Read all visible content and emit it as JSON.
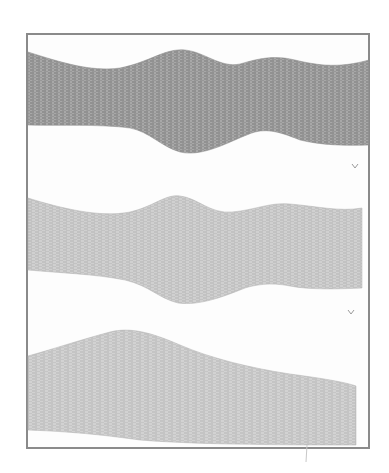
{
  "image": {
    "description": "Grayscale scan of three horizontal tissue strips inside a rectangular frame",
    "panels": [
      {
        "id": "strip-top",
        "tone": "dark",
        "fill": "#9a9a9a"
      },
      {
        "id": "strip-middle",
        "tone": "light",
        "fill": "#c4c4c4"
      },
      {
        "id": "strip-bottom",
        "tone": "light",
        "fill": "#c8c8c8"
      }
    ],
    "marks": [
      "small-v-mark",
      "small-v-mark"
    ],
    "colors": {
      "frame": "#8a8a8a",
      "background": "#ffffff"
    }
  }
}
